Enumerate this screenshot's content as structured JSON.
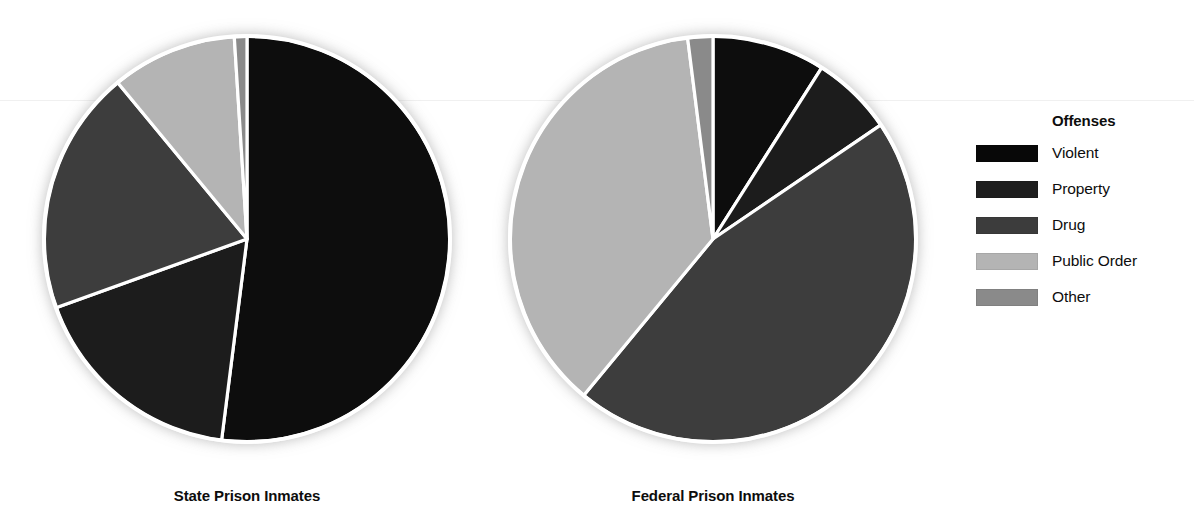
{
  "legend": {
    "title": "Offenses",
    "items": [
      {
        "label": "Violent",
        "color": "#080808"
      },
      {
        "label": "Property",
        "color": "#1e1e1e"
      },
      {
        "label": "Drug",
        "color": "#3c3c3c"
      },
      {
        "label": "Public Order",
        "color": "#b4b4b4"
      },
      {
        "label": "Other",
        "color": "#8a8a8a"
      }
    ]
  },
  "charts": [
    {
      "caption": "State Prison Inmates"
    },
    {
      "caption": "Federal Prison Inmates"
    }
  ],
  "chart_data": [
    {
      "type": "pie",
      "title": "State Prison Inmates",
      "categories": [
        "Violent",
        "Property",
        "Drug",
        "Public Order",
        "Other"
      ],
      "values": [
        52.0,
        17.5,
        19.5,
        10.0,
        1.0
      ],
      "unit": "percent",
      "colors": [
        "#080808",
        "#1e1e1e",
        "#3c3c3c",
        "#b4b4b4",
        "#8a8a8a"
      ],
      "start_angle_deg": 0,
      "direction": "clockwise",
      "legend_position": "right"
    },
    {
      "type": "pie",
      "title": "Federal Prison Inmates",
      "categories": [
        "Violent",
        "Property",
        "Drug",
        "Public Order",
        "Other"
      ],
      "values": [
        9.0,
        6.5,
        45.5,
        37.0,
        2.0
      ],
      "unit": "percent",
      "colors": [
        "#080808",
        "#1e1e1e",
        "#3c3c3c",
        "#b4b4b4",
        "#8a8a8a"
      ],
      "start_angle_deg": 0,
      "direction": "clockwise",
      "legend_position": "right"
    }
  ],
  "geometry": {
    "radius": 203,
    "cx": 239,
    "cy": 239,
    "separator_color": "#ffffff",
    "separator_width": 3.2,
    "outline_color": "#ffffff"
  }
}
